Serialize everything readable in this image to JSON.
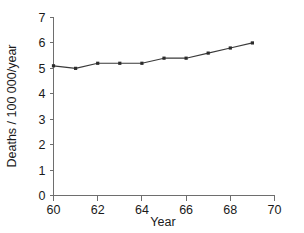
{
  "chart_data": {
    "type": "line",
    "title": "",
    "subtitle": "",
    "xlabel": "Year",
    "ylabel": "Deaths / 100 000/year",
    "x": [
      60,
      61,
      62,
      63,
      64,
      65,
      66,
      67,
      68,
      69
    ],
    "values": [
      5.1,
      5.0,
      5.2,
      5.2,
      5.2,
      5.4,
      5.4,
      5.6,
      5.8,
      6.0
    ],
    "series": [
      {
        "name": "Deaths per 100 000 per year",
        "values": [
          5.1,
          5.0,
          5.2,
          5.2,
          5.2,
          5.4,
          5.4,
          5.6,
          5.8,
          6.0
        ]
      }
    ],
    "xlim": [
      60,
      70
    ],
    "ylim": [
      0,
      7
    ],
    "xticks": [
      60,
      62,
      64,
      66,
      68,
      70
    ],
    "xtick_labels": [
      "60",
      "62",
      "64",
      "66",
      "68",
      "70"
    ],
    "xminorticks": [
      61,
      63,
      65,
      67,
      69
    ],
    "yticks": [
      0,
      1,
      2,
      3,
      4,
      5,
      6,
      7
    ],
    "ytick_labels": [
      "0",
      "1",
      "2",
      "3",
      "4",
      "5",
      "6",
      "7"
    ],
    "grid": false,
    "legend": null,
    "legend_position": "none",
    "annotations": [],
    "marker": "square",
    "line_color": "#3a3a3a",
    "marker_color": "#2b2b2b",
    "axis_color": "#6e6e6e",
    "background_color": "#ffffff"
  }
}
